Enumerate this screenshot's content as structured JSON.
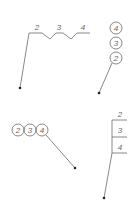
{
  "diagram": {
    "title": "",
    "line_color": "#6a6a6a",
    "dot_color": "#222222",
    "callouts": [
      {
        "style": "horizontal-zigzag",
        "labels": [
          "2",
          "3",
          "4"
        ]
      },
      {
        "style": "vertical-stacked-circles",
        "labels": [
          "4",
          "3",
          "2"
        ]
      },
      {
        "style": "horizontal-circles",
        "labels": [
          "2",
          "3",
          "4"
        ]
      },
      {
        "style": "vertical-stacked-lines",
        "labels": [
          "2",
          "3",
          "4"
        ]
      }
    ]
  }
}
